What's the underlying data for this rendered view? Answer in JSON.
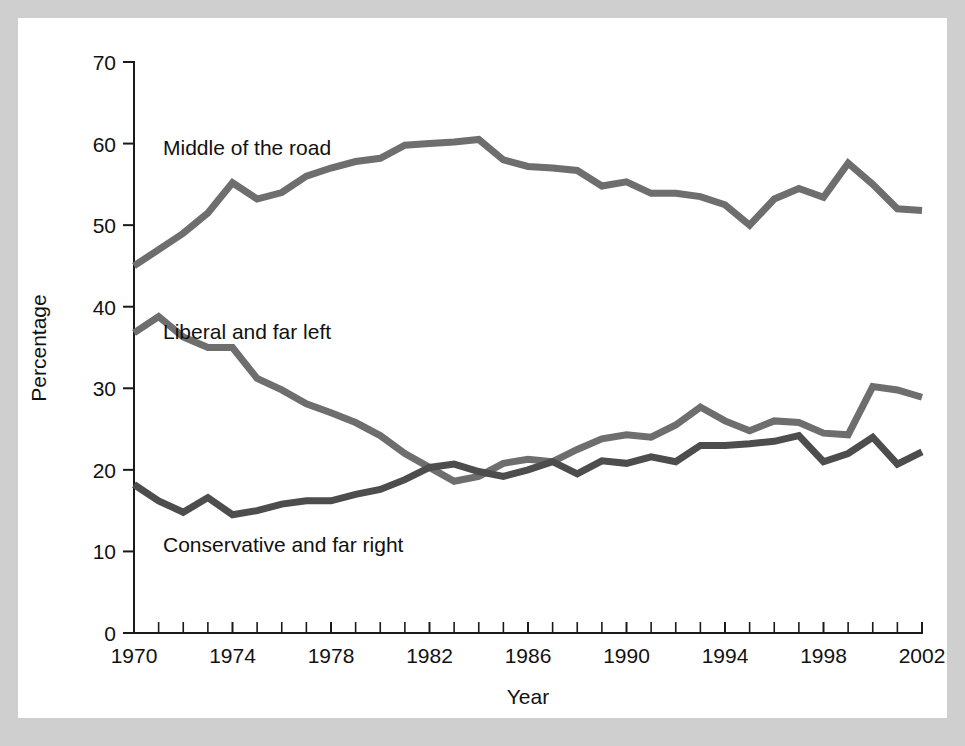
{
  "figure": {
    "border_color": "#cfcfcf",
    "panel_color": "#ffffff"
  },
  "axes": {
    "y_title": "Percentage",
    "x_title": "Year",
    "y_ticks": [
      "0",
      "10",
      "20",
      "30",
      "40",
      "50",
      "60",
      "70"
    ],
    "x_ticks": [
      "1970",
      "1974",
      "1978",
      "1982",
      "1986",
      "1990",
      "1994",
      "1998",
      "2002"
    ]
  },
  "annotations": {
    "middle": "Middle of the road",
    "liberal": "Liberal and far left",
    "conservative": "Conservative and far right"
  },
  "chart_data": {
    "type": "line",
    "title": "",
    "xlabel": "Year",
    "ylabel": "Percentage",
    "xlim": [
      1970,
      2002
    ],
    "ylim": [
      0,
      70
    ],
    "grid": false,
    "legend": "inline annotations on plot",
    "x": [
      1970,
      1971,
      1972,
      1973,
      1974,
      1975,
      1976,
      1977,
      1978,
      1979,
      1980,
      1981,
      1982,
      1983,
      1984,
      1985,
      1986,
      1987,
      1988,
      1989,
      1990,
      1991,
      1992,
      1993,
      1994,
      1995,
      1996,
      1997,
      1998,
      1999,
      2000,
      2001,
      2002
    ],
    "series": [
      {
        "name": "Middle of the road",
        "color": "#6e6e6e",
        "values": [
          45.0,
          47.0,
          49.0,
          51.5,
          55.2,
          53.2,
          54.0,
          56.0,
          57.0,
          57.8,
          58.2,
          59.8,
          60.0,
          60.2,
          60.5,
          58.0,
          57.2,
          57.0,
          56.7,
          54.8,
          55.3,
          53.9,
          53.9,
          53.5,
          52.5,
          50.0,
          53.2,
          54.5,
          53.4,
          57.6,
          55.0,
          52.0,
          51.8
        ]
      },
      {
        "name": "Liberal and far left",
        "color": "#6e6e6e",
        "values": [
          36.8,
          38.8,
          36.3,
          35.0,
          35.0,
          31.2,
          29.8,
          28.1,
          27.0,
          25.8,
          24.2,
          22.0,
          20.3,
          18.6,
          19.2,
          20.8,
          21.3,
          21.0,
          22.5,
          23.8,
          24.3,
          24.0,
          25.5,
          27.7,
          26.0,
          24.8,
          26.0,
          25.8,
          24.5,
          24.3,
          30.2,
          29.8,
          28.9
        ]
      },
      {
        "name": "Conservative and far right",
        "color": "#4d4d4d",
        "values": [
          18.2,
          16.2,
          14.8,
          16.6,
          14.5,
          15.0,
          15.8,
          16.2,
          16.2,
          17.0,
          17.6,
          18.8,
          20.3,
          20.7,
          19.8,
          19.2,
          20.0,
          21.0,
          19.5,
          21.1,
          20.8,
          21.6,
          21.0,
          23.0,
          23.0,
          23.2,
          23.5,
          24.2,
          21.0,
          22.0,
          24.0,
          20.7,
          22.2
        ]
      }
    ]
  }
}
